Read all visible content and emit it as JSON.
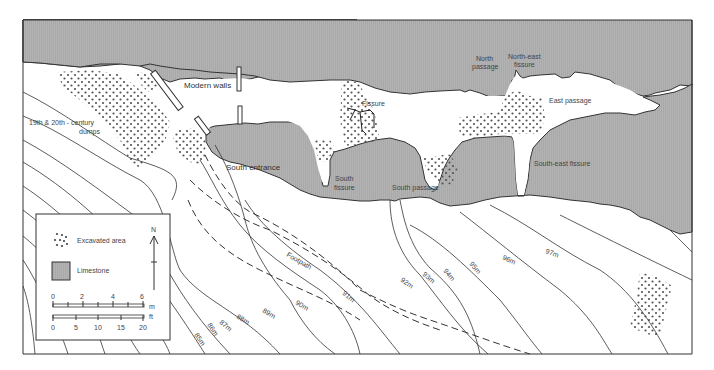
{
  "map": {
    "labels": {
      "modern_walls": "Modern walls",
      "dumps_line1": "19th & 20th - century",
      "dumps_line2": "dumps",
      "south_entrance": "South entrance",
      "south_fissure_1": "South",
      "south_fissure_2": "fissure",
      "fissure": "Fissure",
      "south_passage": "South passage",
      "north_passage_1": "North",
      "north_passage_2": "passage",
      "northeast_fissure_1": "North-east",
      "northeast_fissure_2": "fissure",
      "east_passage": "East passage",
      "southeast_fissure": "South-east fissure",
      "footpath": "Footpath"
    },
    "contours": [
      "85m",
      "86m",
      "87m",
      "88m",
      "89m",
      "90m",
      "91m",
      "92m",
      "93m",
      "94m",
      "95m",
      "96m",
      "97m"
    ],
    "colors": {
      "limestone": "#a9a9a9",
      "line": "#333333",
      "dots": "#555555"
    }
  },
  "legend": {
    "excavated_area": "Excavated area",
    "limestone": "Limestone",
    "north": "N",
    "scale_m": {
      "ticks": [
        "0",
        "2",
        "4",
        "6"
      ],
      "unit": "m"
    },
    "scale_ft": {
      "ticks": [
        "0",
        "5",
        "10",
        "15",
        "20"
      ],
      "unit": "ft"
    }
  }
}
